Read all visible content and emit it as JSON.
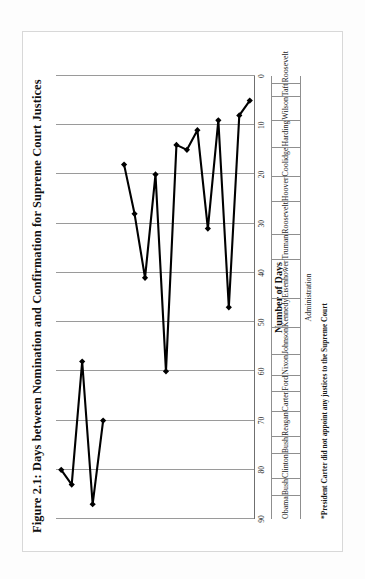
{
  "figure": {
    "title": "Figure 2.1: Days between Nomination and Confirmation for Supreme Court Justices",
    "category_axis_label": "Administration",
    "footnote": "*President Carter did not appoint any justices to the Supreme Court"
  },
  "chart_data": {
    "type": "line",
    "orientation": "rotated-90-ccw",
    "title": "Figure 2.1: Days between Nomination and Confirmation for Supreme Court Justices",
    "xlabel": "Administration",
    "ylabel": "Number of Days",
    "ylim": [
      0,
      90
    ],
    "yticks": [
      90,
      80,
      70,
      60,
      50,
      40,
      30,
      20,
      10,
      0
    ],
    "grid": true,
    "legend": "none",
    "marker": "filled-diamond",
    "categories": [
      "Obama",
      "Bush",
      "Clinton",
      "Bush",
      "Reagan",
      "Carter",
      "Ford",
      "Nixon",
      "Johnson",
      "Kennedy",
      "Eisenhower",
      "Truman",
      "Roosevelt",
      "Hoover",
      "Coolidge",
      "Harding",
      "Wilson",
      "Taft",
      "Roosevelt"
    ],
    "values": [
      80,
      83,
      58,
      87,
      70,
      null,
      18,
      28,
      41,
      20,
      60,
      14,
      15,
      11,
      31,
      9,
      47,
      8,
      5
    ]
  }
}
